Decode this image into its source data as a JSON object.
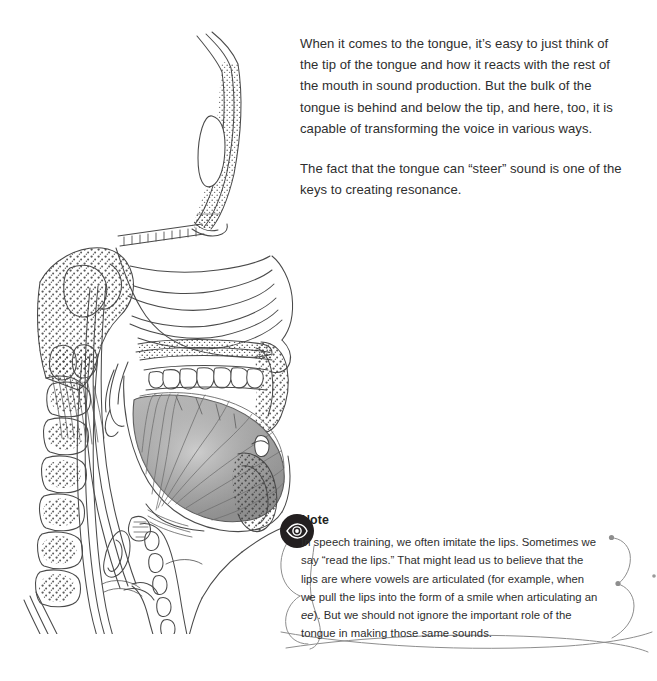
{
  "page": {
    "background_color": "#ffffff",
    "text_color": "#2e2e2e"
  },
  "illustration": {
    "name": "sagittal-head-cross-section",
    "description": "Mid-sagittal anatomical cross-section of a human head and neck showing the nasal cavity, hard palate, teeth, shaded tongue with radiating muscle fibers, pharynx, larynx, cervical vertebrae with trabecular bone stippling, spinal cord and the frontal sinus.",
    "line_color": "#4a4a4a",
    "tongue_fill": "#a9a9a9"
  },
  "body_copy": {
    "paragraphs": [
      "When it comes to the tongue, it’s easy to just think of the tip of the tongue and how it reacts with the rest of the mouth in sound production. But the bulk of the tongue is behind and below the tip, and here, too, it is capable of transforming the voice in various ways.",
      "The fact that the tongue can “steer” sound is one of the keys to creating resonance."
    ]
  },
  "note": {
    "icon": "eye-icon",
    "icon_background": "#231f20",
    "title": "Note",
    "text_before_italic": "In speech training, we often imitate the lips. Sometimes we say “read the lips.” That might lead us to believe that the lips are where vowels are articulated (for example, when we pull the lips into the form of a smile when articulating an ",
    "italic_word": "ee",
    "text_after_italic": "). But we should not ignore the important role of the tongue in making those same sounds.",
    "frame_color": "#8e8e8e"
  }
}
